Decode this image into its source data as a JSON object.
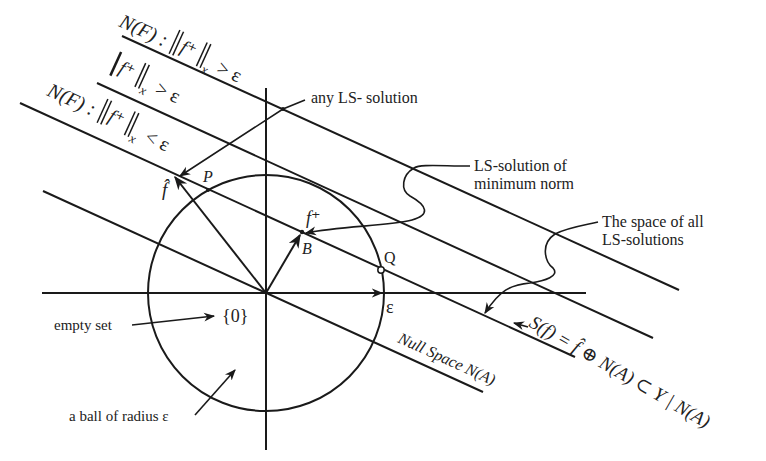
{
  "diagram": {
    "type": "geometric-illustration",
    "colors": {
      "ink": "#1a1a1a",
      "background": "#ffffff"
    },
    "labels": {
      "band_top": "N(F) : ‖f⁺‖ₓ > ε",
      "band_top_prefix": "N(F) :",
      "band_top_norm": "f⁺",
      "band_top_sub": "x",
      "band_top_rel": "> ε",
      "band_mid_norm": "f⁺",
      "band_mid_sub": "x",
      "band_mid_rel": "> ε",
      "band_low_prefix": "N(F) :",
      "band_low_norm": "f⁺",
      "band_low_sub": "x",
      "band_low_rel": "< ε",
      "any_ls_solution": "any LS- solution",
      "ls_min_norm_line1": "LS-solution of",
      "ls_min_norm_line2": "minimum norm",
      "space_all_line1": "The space of all",
      "space_all_line2": "LS-solutions",
      "point_f_hat": "f̂",
      "point_P": "P",
      "point_f_plus": "f⁺",
      "point_B": "B",
      "point_Q": "Q",
      "epsilon_axis": "ε",
      "origin_set": "{0}",
      "empty_set": "empty set",
      "ball": "a ball of radius ε",
      "null_space": "Null Space N(A)",
      "solution_set": "S(f) = f̂ ⊕ N(A) ⊂ Y | N(A)"
    },
    "geometry": {
      "origin": [
        266,
        293
      ],
      "circle_radius": 118,
      "x_axis": [
        [
          42,
          293
        ],
        [
          586,
          293
        ]
      ],
      "y_axis": [
        [
          266,
          88
        ],
        [
          266,
          450
        ]
      ],
      "parallel_lines": [
        {
          "name": "norm-gt-eps-top",
          "from": [
            122,
            36
          ],
          "to": [
            679,
            290
          ]
        },
        {
          "name": "norm-gt-eps-mid",
          "from": [
            97,
            83
          ],
          "to": [
            653,
            338
          ]
        },
        {
          "name": "ls-solutions-line",
          "from": [
            20,
            103
          ],
          "to": [
            575,
            357
          ]
        },
        {
          "name": "null-space-line",
          "from": [
            43,
            191
          ],
          "to": [
            483,
            392
          ]
        }
      ],
      "points": {
        "f_hat": [
          173,
          175
        ],
        "P": [
          208,
          190
        ],
        "B": [
          302,
          232
        ],
        "Q": [
          381,
          270
        ]
      }
    }
  }
}
